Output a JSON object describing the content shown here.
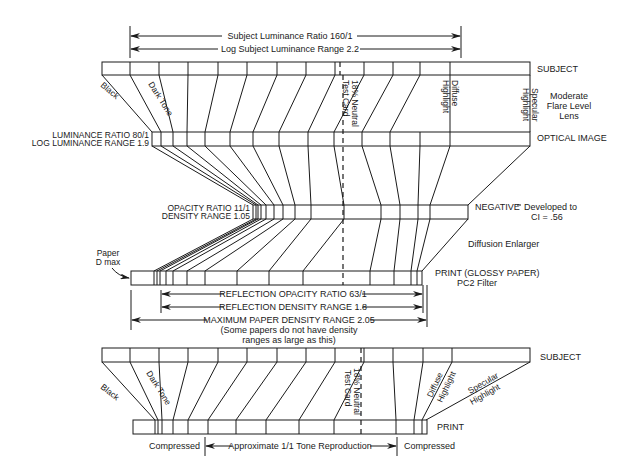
{
  "top_dimensions": {
    "luminance_ratio": "Subject Luminance Ratio 160/1",
    "log_range": "Log Subject Luminance Range 2.2"
  },
  "labels_right": {
    "subject_top": "SUBJECT",
    "flare_line1": "Moderate",
    "flare_line2": "Flare Level",
    "flare_line3": "Lens",
    "optical_image": "OPTICAL IMAGE",
    "negative": "NEGATIVE",
    "negative_dev1": "Developed to",
    "negative_dev2": "CI = .56",
    "enlarger": "Diffusion Enlarger",
    "print_glossy1": "PRINT (GLOSSY PAPER)",
    "print_glossy2": "PC2 Filter",
    "subject_bottom": "SUBJECT",
    "print_bottom": "PRINT"
  },
  "labels_left": {
    "lum_ratio": "LUMINANCE RATIO 80/1",
    "log_lum_range": "LOG LUMINANCE RANGE 1.9",
    "opacity_ratio": "OPACITY RATIO 11/1",
    "density_range": "DENSITY RANGE 1.05",
    "paper_dmax1": "Paper",
    "paper_dmax2": "D max"
  },
  "tone_labels_top": {
    "black": "Black",
    "dark_tone": "Dark Tone",
    "neutral1": "18% Neutral",
    "neutral2": "Test Card",
    "diffuse1": "Diffuse",
    "diffuse2": "Highlight",
    "specular1": "Specular",
    "specular2": "Highlight"
  },
  "print_dimensions": {
    "reflection_opacity": "REFLECTION OPACITY RATIO 63/1",
    "reflection_density": "REFLECTION DENSITY RANGE 1.8",
    "max_paper_density": "MAXIMUM PAPER DENSITY RANGE 2.05",
    "note1": "(Some papers do not have density",
    "note2": "ranges as large as this)"
  },
  "tone_labels_bottom": {
    "black": "Black",
    "dark_tone": "Dark Tone",
    "neutral1": "18% Neutral",
    "neutral2": "Test Card",
    "diffuse1": "Diffuse",
    "diffuse2": "Highlight",
    "specular1": "Specular",
    "specular2": "Highlight"
  },
  "bottom_dimensions": {
    "compressed_left": "Compressed",
    "approx": "Approximate 1/1 Tone Reproduction",
    "compressed_right": "Compressed"
  }
}
